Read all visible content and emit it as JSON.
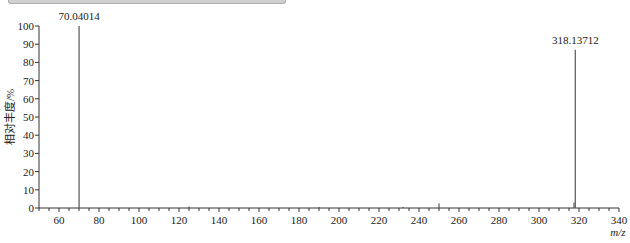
{
  "chart_data": {
    "type": "bar",
    "subtype": "mass-spectrum-stick",
    "title": "",
    "xlabel": "m/z",
    "ylabel": "相对丰度/%",
    "xlim": [
      50,
      340
    ],
    "ylim": [
      0,
      100
    ],
    "x_ticks": [
      60,
      80,
      100,
      120,
      140,
      160,
      180,
      200,
      220,
      240,
      260,
      280,
      300,
      320,
      340
    ],
    "y_ticks": [
      0,
      10,
      20,
      30,
      40,
      50,
      60,
      70,
      80,
      90,
      100
    ],
    "grid": false,
    "peaks": [
      {
        "mz": 70.04014,
        "intensity": 100,
        "label": "70.04014"
      },
      {
        "mz": 125.0,
        "intensity": 0.8,
        "label": ""
      },
      {
        "mz": 190.0,
        "intensity": 0.5,
        "label": ""
      },
      {
        "mz": 232.0,
        "intensity": 0.6,
        "label": ""
      },
      {
        "mz": 250.0,
        "intensity": 2.5,
        "label": ""
      },
      {
        "mz": 317.5,
        "intensity": 3.0,
        "label": ""
      },
      {
        "mz": 318.13712,
        "intensity": 87,
        "label": "318.13712"
      }
    ],
    "annotations": [
      "70.04014",
      "318.13712"
    ]
  },
  "axis": {
    "x_label": "m/z",
    "y_label": "相对丰度/%"
  }
}
